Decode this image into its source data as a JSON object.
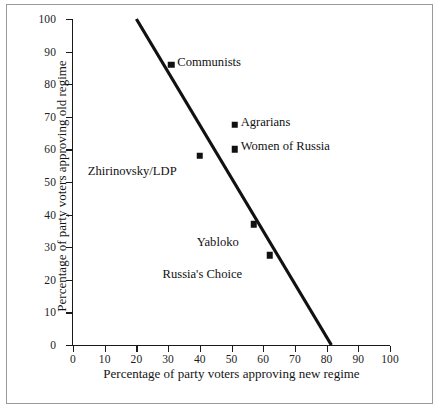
{
  "chart_data": {
    "type": "scatter",
    "title": "",
    "xlabel": "Percentage of party voters approving new regime",
    "ylabel": "Percentage of party voters approving old regime",
    "xlim": [
      0,
      100
    ],
    "ylim": [
      0,
      100
    ],
    "grid": false,
    "legend": "none",
    "xticks": [
      "0",
      "10",
      "20",
      "30",
      "40",
      "50",
      "60",
      "70",
      "80",
      "90",
      "100"
    ],
    "xtick_values": [
      0,
      10,
      20,
      30,
      40,
      50,
      60,
      70,
      80,
      90,
      100
    ],
    "yticks": [
      "0",
      "10",
      "20",
      "30",
      "40",
      "50",
      "60",
      "70",
      "80",
      "90",
      "100"
    ],
    "ytick_values": [
      0,
      10,
      20,
      30,
      40,
      50,
      60,
      70,
      80,
      90,
      100
    ],
    "marker_shape": "filled-square",
    "marker_color": "#111111",
    "points": [
      {
        "label": "Communists",
        "x": 31,
        "y": 86,
        "label_dx": 6,
        "label_dy": -9
      },
      {
        "label": "Agrarians",
        "x": 51,
        "y": 67.5,
        "label_dx": 6,
        "label_dy": -9
      },
      {
        "label": "Women of Russia",
        "x": 51,
        "y": 60,
        "label_dx": 6,
        "label_dy": -9
      },
      {
        "label": "Zhirinovsky/LDP",
        "x": 40,
        "y": 58,
        "label_dx": -112,
        "label_dy": 9
      },
      {
        "label": "Yabloko",
        "x": 57,
        "y": 37,
        "label_dx": -57,
        "label_dy": 12
      },
      {
        "label": "Russia's Choice",
        "x": 62,
        "y": 27.5,
        "label_dx": -107,
        "label_dy": 13
      }
    ],
    "trendline": {
      "x1": 20,
      "y1": 100,
      "x2": 81.5,
      "y2": 0,
      "color": "#111111",
      "width": 3.2
    },
    "axis_color": "#1a1a1a",
    "frame_color": "#9a9a9a",
    "background": "#ffffff"
  }
}
